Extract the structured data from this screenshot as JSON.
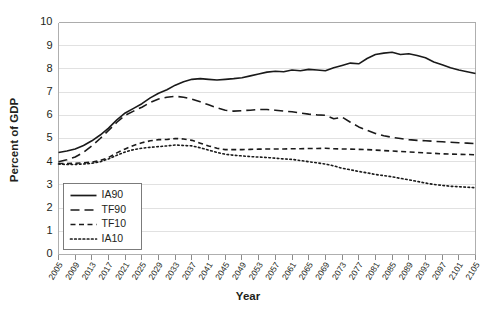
{
  "chart_data": {
    "type": "line",
    "title": "",
    "xlabel": "Year",
    "ylabel": "Percent of GDP",
    "xlim": [
      2005,
      2105
    ],
    "ylim": [
      0,
      10
    ],
    "grid": true,
    "legend_position": "lower-left-inside",
    "ytick_labels": [
      "0",
      "1",
      "2",
      "3",
      "4",
      "5",
      "6",
      "7",
      "8",
      "9",
      "10"
    ],
    "ytick_values": [
      0,
      1,
      2,
      3,
      4,
      5,
      6,
      7,
      8,
      9,
      10
    ],
    "xtick_labels": [
      "2005",
      "2009",
      "2013",
      "2017",
      "2021",
      "2025",
      "2029",
      "2033",
      "2037",
      "2041",
      "2045",
      "2049",
      "2053",
      "2057",
      "2061",
      "2065",
      "2069",
      "2073",
      "2077",
      "2081",
      "2085",
      "2089",
      "2093",
      "2097",
      "2101",
      "2105"
    ],
    "xtick_values": [
      2005,
      2009,
      2013,
      2017,
      2021,
      2025,
      2029,
      2033,
      2037,
      2041,
      2045,
      2049,
      2053,
      2057,
      2061,
      2065,
      2069,
      2073,
      2077,
      2081,
      2085,
      2089,
      2093,
      2097,
      2101,
      2105
    ],
    "x": [
      2005,
      2007,
      2009,
      2011,
      2013,
      2015,
      2017,
      2019,
      2021,
      2023,
      2025,
      2027,
      2029,
      2031,
      2033,
      2035,
      2037,
      2039,
      2041,
      2043,
      2045,
      2047,
      2049,
      2051,
      2053,
      2055,
      2057,
      2059,
      2061,
      2063,
      2065,
      2067,
      2069,
      2071,
      2073,
      2075,
      2077,
      2079,
      2081,
      2083,
      2085,
      2087,
      2089,
      2091,
      2093,
      2095,
      2097,
      2099,
      2101,
      2103,
      2105
    ],
    "series": [
      {
        "name": "IA90",
        "style": "solid",
        "color": "#1a1a1a",
        "values": [
          4.4,
          4.46,
          4.55,
          4.7,
          4.9,
          5.15,
          5.45,
          5.8,
          6.1,
          6.3,
          6.5,
          6.75,
          6.95,
          7.1,
          7.3,
          7.45,
          7.55,
          7.58,
          7.55,
          7.52,
          7.55,
          7.58,
          7.62,
          7.7,
          7.78,
          7.86,
          7.9,
          7.88,
          7.95,
          7.92,
          7.98,
          7.95,
          7.92,
          8.05,
          8.15,
          8.25,
          8.22,
          8.45,
          8.62,
          8.68,
          8.72,
          8.62,
          8.65,
          8.58,
          8.48,
          8.3,
          8.18,
          8.05,
          7.95,
          7.88,
          7.8
        ]
      },
      {
        "name": "TF90",
        "style": "long-dash",
        "color": "#1a1a1a",
        "values": [
          4.0,
          4.08,
          4.2,
          4.4,
          4.68,
          5.0,
          5.35,
          5.7,
          6.0,
          6.18,
          6.35,
          6.55,
          6.7,
          6.78,
          6.82,
          6.78,
          6.7,
          6.58,
          6.45,
          6.32,
          6.22,
          6.18,
          6.2,
          6.22,
          6.25,
          6.25,
          6.22,
          6.18,
          6.15,
          6.1,
          6.05,
          6.02,
          6.0,
          5.85,
          5.92,
          5.7,
          5.5,
          5.35,
          5.22,
          5.12,
          5.05,
          5.0,
          4.95,
          4.92,
          4.9,
          4.88,
          4.86,
          4.84,
          4.82,
          4.8,
          4.78
        ]
      },
      {
        "name": "TF10",
        "style": "short-dash",
        "color": "#1a1a1a",
        "values": [
          3.92,
          3.92,
          3.93,
          3.95,
          3.98,
          4.05,
          4.18,
          4.38,
          4.55,
          4.7,
          4.82,
          4.9,
          4.95,
          4.96,
          5.0,
          4.98,
          4.92,
          4.8,
          4.68,
          4.58,
          4.52,
          4.52,
          4.52,
          4.53,
          4.54,
          4.55,
          4.55,
          4.55,
          4.56,
          4.56,
          4.57,
          4.57,
          4.58,
          4.56,
          4.55,
          4.54,
          4.53,
          4.52,
          4.5,
          4.48,
          4.46,
          4.44,
          4.42,
          4.4,
          4.38,
          4.36,
          4.34,
          4.33,
          4.32,
          4.31,
          4.3
        ]
      },
      {
        "name": "IA10",
        "style": "dotted",
        "color": "#1a1a1a",
        "values": [
          3.9,
          3.88,
          3.88,
          3.9,
          3.93,
          4.0,
          4.12,
          4.28,
          4.42,
          4.52,
          4.58,
          4.62,
          4.65,
          4.68,
          4.72,
          4.7,
          4.68,
          4.6,
          4.5,
          4.4,
          4.32,
          4.28,
          4.25,
          4.22,
          4.2,
          4.18,
          4.15,
          4.12,
          4.1,
          4.05,
          4.0,
          3.95,
          3.9,
          3.82,
          3.72,
          3.65,
          3.58,
          3.52,
          3.45,
          3.4,
          3.35,
          3.28,
          3.22,
          3.15,
          3.08,
          3.02,
          2.98,
          2.94,
          2.92,
          2.9,
          2.88
        ]
      }
    ],
    "legend_entries": [
      {
        "label": "IA90",
        "style": "solid"
      },
      {
        "label": "TF90",
        "style": "long-dash"
      },
      {
        "label": "TF10",
        "style": "short-dash"
      },
      {
        "label": "IA10",
        "style": "dotted"
      }
    ]
  }
}
